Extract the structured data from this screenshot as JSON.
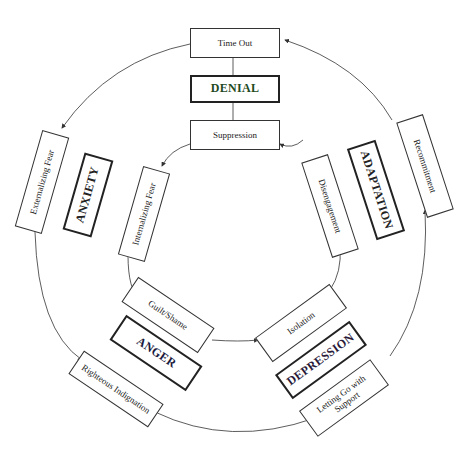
{
  "title": "",
  "stages": [
    {
      "name": "DENIAL",
      "outer": "Time Out",
      "inner": "Suppression",
      "color": "#1a3a1a"
    },
    {
      "name": "ANXIETY",
      "outer": "Externalizing Fear",
      "inner": "Internalizing Fear"
    },
    {
      "name": "ANGER",
      "outer": "Righteous Indignation",
      "inner": "Guilt/Shame"
    },
    {
      "name": "DEPRESSION",
      "outer": "Letting Go with Support",
      "inner": "Isolation"
    },
    {
      "name": "ADAPTATION",
      "outer": "Recommitment",
      "inner": "Disengagement"
    }
  ],
  "colors": {
    "line": "#333333",
    "stage_border": "#222222",
    "background": "#ffffff"
  }
}
